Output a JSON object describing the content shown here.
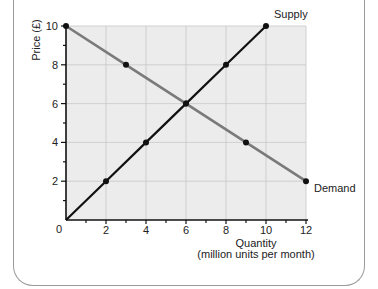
{
  "chart_data": {
    "type": "line",
    "title": "",
    "xlabel": "Quantity",
    "xlabel_sub": "(million units per month)",
    "ylabel": "Price (£)",
    "xlim": [
      0,
      12
    ],
    "ylim": [
      0,
      10
    ],
    "x_ticks": [
      0,
      2,
      4,
      6,
      8,
      10,
      12
    ],
    "y_ticks": [
      2,
      4,
      6,
      8,
      10
    ],
    "origin_label": "0",
    "grid": true,
    "series": [
      {
        "name": "Supply",
        "color": "#111111",
        "points": [
          [
            0,
            0
          ],
          [
            2,
            2
          ],
          [
            4,
            4
          ],
          [
            6,
            6
          ],
          [
            8,
            8
          ],
          [
            10,
            10
          ]
        ],
        "markers": [
          [
            2,
            2
          ],
          [
            4,
            4
          ],
          [
            6,
            6
          ],
          [
            8,
            8
          ],
          [
            10,
            10
          ]
        ]
      },
      {
        "name": "Demand",
        "color": "#7a7a7a",
        "points": [
          [
            0,
            10
          ],
          [
            3,
            8
          ],
          [
            6,
            6
          ],
          [
            9,
            4
          ],
          [
            12,
            2
          ]
        ],
        "markers": [
          [
            0,
            10
          ],
          [
            3,
            8
          ],
          [
            6,
            6
          ],
          [
            9,
            4
          ],
          [
            12,
            2
          ]
        ]
      }
    ],
    "equilibrium": {
      "quantity": 6,
      "price": 6
    }
  },
  "colors": {
    "plot_background": "#ececec",
    "grid": "#c8c8c8",
    "axis": "#111111",
    "frame": "#9a9a9a"
  }
}
